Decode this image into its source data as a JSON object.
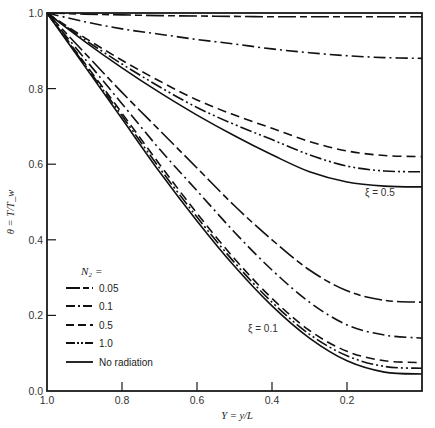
{
  "chart_data": {
    "type": "line",
    "title": "",
    "xlabel": "Y = y/L",
    "ylabel": "θ = T/T_w",
    "xlim": [
      1.0,
      0.0
    ],
    "ylim": [
      0.0,
      1.0
    ],
    "x_reversed": true,
    "grid": false,
    "xticks": [
      "1.0",
      "0.8",
      "0.6",
      "0.4",
      "0.2"
    ],
    "yticks": [
      "0.0",
      "0.2",
      "0.4",
      "0.6",
      "0.8",
      "1.0"
    ],
    "legend": {
      "title": "N₂ =",
      "position": "lower-left",
      "entries": [
        {
          "label": "0.05",
          "style": "long-short-dash"
        },
        {
          "label": "0.1",
          "style": "dash-dot"
        },
        {
          "label": "0.5",
          "style": "dashed"
        },
        {
          "label": "1.0",
          "style": "dash-dot-dot"
        },
        {
          "label": "No radiation",
          "style": "solid"
        }
      ]
    },
    "annotations": [
      {
        "text": "ξ = 0.5",
        "x": 0.1,
        "y": 0.52
      },
      {
        "text": "ξ = 0.1",
        "x": 0.45,
        "y": 0.17
      }
    ],
    "x": [
      1.0,
      0.9,
      0.8,
      0.7,
      0.6,
      0.5,
      0.4,
      0.3,
      0.2,
      0.1,
      0.0
    ],
    "series": [
      {
        "name": "ξ=0.5, N2=0.05",
        "xi": 0.5,
        "N2": "0.05",
        "style": "long-short-dash",
        "values": [
          1.0,
          0.997,
          0.995,
          0.993,
          0.992,
          0.991,
          0.99,
          0.99,
          0.99,
          0.99,
          0.99
        ]
      },
      {
        "name": "ξ=0.5, N2=0.1",
        "xi": 0.5,
        "N2": "0.1",
        "style": "dash-dot",
        "values": [
          1.0,
          0.977,
          0.958,
          0.944,
          0.93,
          0.918,
          0.905,
          0.895,
          0.887,
          0.882,
          0.88
        ]
      },
      {
        "name": "ξ=0.5, N2=0.5",
        "xi": 0.5,
        "N2": "0.5",
        "style": "dashed",
        "values": [
          1.0,
          0.935,
          0.875,
          0.82,
          0.77,
          0.73,
          0.695,
          0.66,
          0.635,
          0.623,
          0.62
        ]
      },
      {
        "name": "ξ=0.5, N2=1.0",
        "xi": 0.5,
        "N2": "1.0",
        "style": "dash-dot-dot",
        "values": [
          1.0,
          0.93,
          0.865,
          0.805,
          0.75,
          0.705,
          0.665,
          0.625,
          0.595,
          0.582,
          0.58
        ]
      },
      {
        "name": "ξ=0.5, No radiation",
        "xi": 0.5,
        "N2": "none",
        "style": "solid",
        "values": [
          1.0,
          0.925,
          0.855,
          0.79,
          0.73,
          0.675,
          0.625,
          0.58,
          0.553,
          0.542,
          0.54
        ]
      },
      {
        "name": "ξ=0.1, N2=0.05",
        "xi": 0.1,
        "N2": "0.05",
        "style": "long-short-dash",
        "values": [
          1.0,
          0.895,
          0.79,
          0.69,
          0.59,
          0.49,
          0.4,
          0.32,
          0.265,
          0.24,
          0.235
        ]
      },
      {
        "name": "ξ=0.1, N2=0.1",
        "xi": 0.1,
        "N2": "0.1",
        "style": "dash-dot",
        "values": [
          1.0,
          0.88,
          0.76,
          0.64,
          0.53,
          0.42,
          0.32,
          0.235,
          0.175,
          0.148,
          0.14
        ]
      },
      {
        "name": "ξ=0.1, N2=0.5",
        "xi": 0.1,
        "N2": "0.5",
        "style": "dashed",
        "values": [
          1.0,
          0.868,
          0.735,
          0.6,
          0.47,
          0.35,
          0.245,
          0.16,
          0.105,
          0.08,
          0.075
        ]
      },
      {
        "name": "ξ=0.1, N2=1.0",
        "xi": 0.1,
        "N2": "1.0",
        "style": "dash-dot-dot",
        "values": [
          1.0,
          0.864,
          0.728,
          0.59,
          0.46,
          0.34,
          0.235,
          0.15,
          0.093,
          0.065,
          0.06
        ]
      },
      {
        "name": "ξ=0.1, No radiation",
        "xi": 0.1,
        "N2": "none",
        "style": "solid",
        "values": [
          1.0,
          0.86,
          0.72,
          0.58,
          0.45,
          0.33,
          0.225,
          0.14,
          0.08,
          0.05,
          0.045
        ]
      }
    ]
  }
}
